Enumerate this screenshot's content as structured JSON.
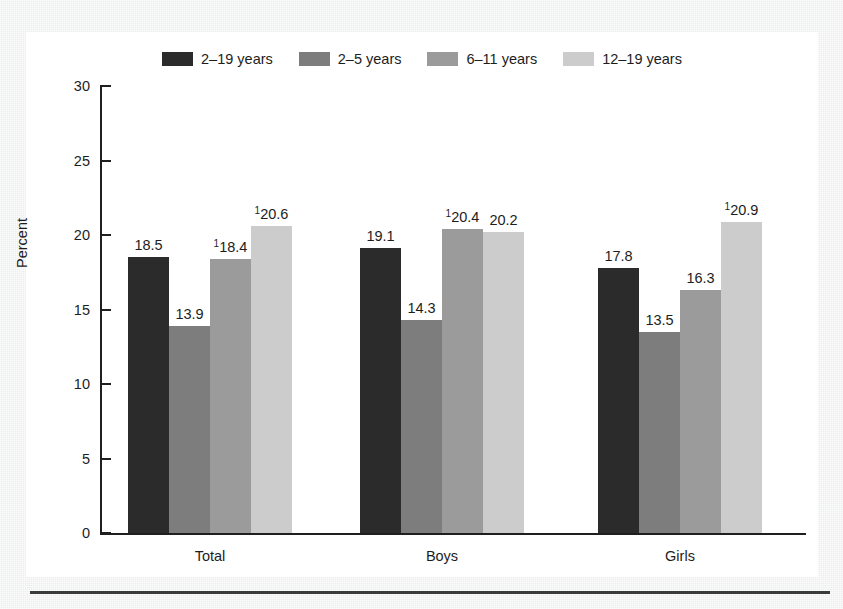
{
  "chart_data": {
    "type": "bar",
    "title": "",
    "xlabel": "",
    "ylabel": "Percent",
    "ylim": [
      0,
      30
    ],
    "yticks": [
      0,
      5,
      10,
      15,
      20,
      25,
      30
    ],
    "grid": false,
    "legend_position": "top-center",
    "categories": [
      "Total",
      "Boys",
      "Girls"
    ],
    "series": [
      {
        "name": "2–19 years",
        "color": "#2b2b2b",
        "values": [
          18.5,
          19.1,
          17.8
        ],
        "labels": [
          "18.5",
          "19.1",
          "17.8"
        ],
        "footnote_marks": [
          "",
          "",
          ""
        ]
      },
      {
        "name": "2–5 years",
        "color": "#7d7d7d",
        "values": [
          13.9,
          14.3,
          13.5
        ],
        "labels": [
          "13.9",
          "14.3",
          "13.5"
        ],
        "footnote_marks": [
          "",
          "",
          ""
        ]
      },
      {
        "name": "6–11 years",
        "color": "#9b9b9b",
        "values": [
          18.4,
          20.4,
          16.3
        ],
        "labels": [
          "18.4",
          "20.4",
          "16.3"
        ],
        "footnote_marks": [
          "1",
          "1",
          ""
        ]
      },
      {
        "name": "12–19 years",
        "color": "#cccccc",
        "values": [
          20.6,
          20.2,
          20.9
        ],
        "labels": [
          "20.6",
          "20.2",
          "20.9"
        ],
        "footnote_marks": [
          "1",
          "",
          "1"
        ]
      }
    ]
  },
  "colors": {
    "axis": "#1f1f1f",
    "text": "#1d1d1d",
    "canvas": "#ffffff",
    "page": "#eceded",
    "rule": "#3b3b3b"
  }
}
